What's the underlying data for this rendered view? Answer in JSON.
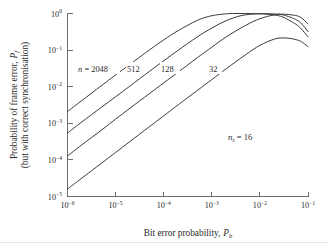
{
  "figure": {
    "background_color": "#ffffff",
    "axis_color": "#6e6e6e",
    "curve_color": "#3a3a3a"
  },
  "chart_data": {
    "type": "line",
    "title": "",
    "xlabel": "Bit error probability, P_b",
    "ylabel": "Probability of frame error, P_f (but with correct synchronisation)",
    "xscale": "log",
    "yscale": "log",
    "xlim": [
      1e-06,
      0.1
    ],
    "ylim": [
      1e-05,
      1.0
    ],
    "grid": false,
    "legend_position": "inline-curve-labels",
    "x_tick_labels": [
      "10−6",
      "10−5",
      "10−4",
      "10−3",
      "10−2",
      "10−1"
    ],
    "x_tick_values": [
      1e-06,
      1e-05,
      0.0001,
      0.001,
      0.01,
      0.1
    ],
    "y_tick_labels": [
      "10−0",
      "10−1",
      "10−2",
      "10−3",
      "10−4",
      "10−5"
    ],
    "y_tick_values": [
      1,
      0.1,
      0.01,
      0.001,
      0.0001,
      1e-05
    ],
    "annotations": [
      {
        "name": "ns-annotation",
        "text": "n_s = 16",
        "x": 0.002,
        "y": 0.0006
      }
    ],
    "series": [
      {
        "name": "n = 2048",
        "label": "n = 2048",
        "x": [
          1e-06,
          2e-06,
          5e-06,
          1e-05,
          2e-05,
          5e-05,
          0.0001,
          0.0002,
          0.0005,
          0.001,
          0.002,
          0.003,
          0.005,
          0.008,
          0.012,
          0.02,
          0.03,
          0.05,
          0.07,
          0.1
        ],
        "y": [
          0.0021,
          0.0042,
          0.0105,
          0.021,
          0.041,
          0.1,
          0.19,
          0.34,
          0.65,
          0.87,
          0.98,
          1.0,
          1.0,
          0.99,
          0.97,
          0.91,
          0.8,
          0.56,
          0.4,
          0.23
        ]
      },
      {
        "name": "n = 512",
        "label": "512",
        "x": [
          1e-06,
          2e-06,
          5e-06,
          1e-05,
          2e-05,
          5e-05,
          0.0001,
          0.0002,
          0.0005,
          0.001,
          0.002,
          0.004,
          0.007,
          0.012,
          0.02,
          0.03,
          0.05,
          0.07,
          0.1
        ],
        "y": [
          0.00054,
          0.0011,
          0.0027,
          0.0053,
          0.0105,
          0.026,
          0.051,
          0.099,
          0.23,
          0.4,
          0.64,
          0.87,
          0.96,
          0.99,
          0.97,
          0.92,
          0.73,
          0.56,
          0.32
        ]
      },
      {
        "name": "n = 128",
        "label": "128",
        "x": [
          1e-06,
          2e-06,
          5e-06,
          1e-05,
          2e-05,
          5e-05,
          0.0001,
          0.0002,
          0.0005,
          0.001,
          0.002,
          0.005,
          0.01,
          0.02,
          0.03,
          0.05,
          0.07,
          0.1
        ],
        "y": [
          0.000128,
          0.00026,
          0.00064,
          0.0013,
          0.0026,
          0.0064,
          0.0127,
          0.025,
          0.062,
          0.12,
          0.23,
          0.47,
          0.72,
          0.92,
          0.96,
          0.9,
          0.79,
          0.52
        ]
      },
      {
        "name": "n = 32",
        "label": "32",
        "x": [
          1e-06,
          2e-06,
          5e-06,
          1e-05,
          2e-05,
          5e-05,
          0.0001,
          0.0002,
          0.0005,
          0.001,
          0.002,
          0.005,
          0.01,
          0.02,
          0.03,
          0.04,
          0.05,
          0.07,
          0.1
        ],
        "y": [
          1.6e-05,
          3.2e-05,
          8e-05,
          0.00016,
          0.00032,
          0.0008,
          0.0016,
          0.0032,
          0.0079,
          0.0156,
          0.031,
          0.074,
          0.135,
          0.2,
          0.215,
          0.21,
          0.2,
          0.175,
          0.125
        ]
      }
    ]
  },
  "labels": {
    "xaxis_main": "Bit error probability,",
    "xaxis_symbol": "P",
    "xaxis_symbol_sub": "b",
    "yaxis_line1_main": "Probability of frame error,",
    "yaxis_line1_symbol": "P",
    "yaxis_line1_symbol_sub": "f",
    "yaxis_line2": "(but with correct synchronisation)",
    "curve_2048_prefix": "n",
    "curve_2048_eq": "= 2048",
    "curve_512": "512",
    "curve_128": "128",
    "curve_32": "32",
    "ns_symbol": "n",
    "ns_sub": "s",
    "ns_value": "= 16"
  },
  "ticks": {
    "x": [
      {
        "mantissa": "10",
        "exponent": "−6"
      },
      {
        "mantissa": "10",
        "exponent": "−5"
      },
      {
        "mantissa": "10",
        "exponent": "−4"
      },
      {
        "mantissa": "10",
        "exponent": "−3"
      },
      {
        "mantissa": "10",
        "exponent": "−2"
      },
      {
        "mantissa": "10",
        "exponent": "−1"
      }
    ],
    "y": [
      {
        "mantissa": "10",
        "exponent": "0"
      },
      {
        "mantissa": "10",
        "exponent": "−1"
      },
      {
        "mantissa": "10",
        "exponent": "−2"
      },
      {
        "mantissa": "10",
        "exponent": "−3"
      },
      {
        "mantissa": "10",
        "exponent": "−4"
      },
      {
        "mantissa": "10",
        "exponent": "−5"
      }
    ]
  }
}
